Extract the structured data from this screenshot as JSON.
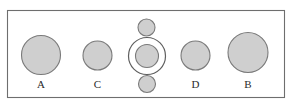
{
  "figure": {
    "canvas": {
      "width": 291,
      "height": 110,
      "background": "#ffffff"
    },
    "frame": {
      "name": "outer-border",
      "x": 7.5,
      "y": 10.5,
      "width": 277,
      "height": 87,
      "stroke": "#6e6e6e",
      "fill": "#ffffff"
    },
    "style": {
      "disc_fill": "#cfcfcf",
      "disc_stroke": "#7a7a7a",
      "ring_stroke": "#5f5f5f",
      "label_color": "#2b2b2b"
    },
    "nodes": [
      {
        "id": "A",
        "label": "A",
        "cx": 41,
        "cy": 55,
        "r": 19.5,
        "type": "disc",
        "label_x": 41,
        "label_y": 88
      },
      {
        "id": "C",
        "label": "C",
        "cx": 97.5,
        "cy": 55.5,
        "r": 14.5,
        "type": "disc",
        "label_x": 97.5,
        "label_y": 88
      },
      {
        "id": "center",
        "label": "",
        "cx": 147,
        "cy": 56,
        "r": 11.5,
        "type": "disc-in-ring",
        "ring_r": 18.5,
        "label_x": 147,
        "label_y": 88
      },
      {
        "id": "top-small",
        "label": "",
        "cx": 146.5,
        "cy": 27.5,
        "r": 8.5,
        "type": "disc",
        "label_x": 146.5,
        "label_y": 27.5
      },
      {
        "id": "bottom-small",
        "label": "",
        "cx": 147,
        "cy": 84,
        "r": 8.5,
        "type": "disc",
        "label_x": 147,
        "label_y": 84
      },
      {
        "id": "D",
        "label": "D",
        "cx": 195.5,
        "cy": 55.5,
        "r": 14.5,
        "type": "disc",
        "label_x": 195.5,
        "label_y": 88
      },
      {
        "id": "B",
        "label": "B",
        "cx": 248,
        "cy": 52.5,
        "r": 20,
        "type": "disc",
        "label_x": 248,
        "label_y": 88
      }
    ],
    "labels": [
      {
        "name": "node-label-a",
        "text": "A"
      },
      {
        "name": "node-label-c",
        "text": "C"
      },
      {
        "name": "node-label-d",
        "text": "D"
      },
      {
        "name": "node-label-b",
        "text": "B"
      }
    ]
  }
}
